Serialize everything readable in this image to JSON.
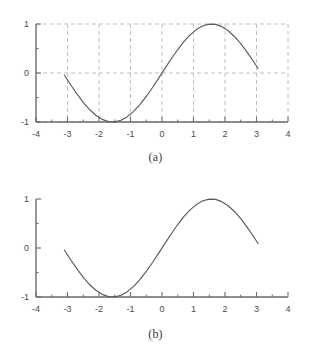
{
  "figure": {
    "background_color": "#ffffff",
    "axis_color": "#6b6b6b",
    "curve_color": "#5a5a5a",
    "grid_color": "#b9b9b9",
    "label_color": "#4a4a4a"
  },
  "panels": [
    {
      "id": "a",
      "caption": "(a)",
      "chart_data": {
        "type": "line",
        "title": "",
        "xlabel": "",
        "ylabel": "",
        "xlim": [
          -4,
          4
        ],
        "ylim": [
          -1,
          1
        ],
        "grid": true,
        "grid_style": "dashed",
        "grid_x": [
          -3,
          -2,
          -1,
          0,
          1,
          2,
          3,
          4
        ],
        "grid_y": [
          -1,
          0,
          1
        ],
        "xticks": [
          -4,
          -3,
          -2,
          -1,
          0,
          1,
          2,
          3,
          4
        ],
        "xticklabels": [
          "-4",
          "-3",
          "-2",
          "-1",
          "0",
          "1",
          "2",
          "3",
          "4"
        ],
        "xminorticks": [
          -3.5,
          -2.5,
          -1.5,
          -0.5,
          0.5,
          1.5,
          2.5,
          3.5
        ],
        "yticks": [
          -1,
          0,
          1
        ],
        "yticklabels": [
          "-1",
          "0",
          "1"
        ],
        "yminorticks": [
          -0.5,
          0.5
        ],
        "series": [
          {
            "name": "sin(x)",
            "x": [
              -3.1,
              -2.9,
              -2.7,
              -2.5,
              -2.3,
              -2.1,
              -1.9,
              -1.7,
              -1.5,
              -1.3,
              -1.1,
              -0.9,
              -0.7,
              -0.5,
              -0.3,
              -0.1,
              0.1,
              0.3,
              0.5,
              0.7,
              0.9,
              1.1,
              1.3,
              1.5,
              1.7,
              1.9,
              2.1,
              2.3,
              2.5,
              2.7,
              2.9,
              3.05
            ],
            "y": [
              -0.042,
              -0.239,
              -0.427,
              -0.599,
              -0.746,
              -0.863,
              -0.946,
              -0.992,
              -0.997,
              -0.964,
              -0.891,
              -0.783,
              -0.644,
              -0.479,
              -0.296,
              -0.1,
              0.1,
              0.296,
              0.479,
              0.644,
              0.783,
              0.891,
              0.964,
              0.997,
              0.992,
              0.946,
              0.863,
              0.746,
              0.599,
              0.427,
              0.239,
              0.092
            ]
          }
        ]
      }
    },
    {
      "id": "b",
      "caption": "(b)",
      "chart_data": {
        "type": "line",
        "title": "",
        "xlabel": "",
        "ylabel": "",
        "xlim": [
          -4,
          4
        ],
        "ylim": [
          -1,
          1
        ],
        "grid": false,
        "grid_style": "none",
        "grid_x": [],
        "grid_y": [],
        "xticks": [
          -4,
          -3,
          -2,
          -1,
          0,
          1,
          2,
          3,
          4
        ],
        "xticklabels": [
          "-4",
          "-3",
          "-2",
          "-1",
          "0",
          "1",
          "2",
          "3",
          "4"
        ],
        "xminorticks": [
          -3.5,
          -2.5,
          -1.5,
          -0.5,
          0.5,
          1.5,
          2.5,
          3.5
        ],
        "yticks": [
          -1,
          0,
          1
        ],
        "yticklabels": [
          "-1",
          "0",
          "1"
        ],
        "yminorticks": [
          -0.5,
          0.5
        ],
        "series": [
          {
            "name": "sin(x)",
            "x": [
              -3.1,
              -2.9,
              -2.7,
              -2.5,
              -2.3,
              -2.1,
              -1.9,
              -1.7,
              -1.5,
              -1.3,
              -1.1,
              -0.9,
              -0.7,
              -0.5,
              -0.3,
              -0.1,
              0.1,
              0.3,
              0.5,
              0.7,
              0.9,
              1.1,
              1.3,
              1.5,
              1.7,
              1.9,
              2.1,
              2.3,
              2.5,
              2.7,
              2.9,
              3.05
            ],
            "y": [
              -0.042,
              -0.239,
              -0.427,
              -0.599,
              -0.746,
              -0.863,
              -0.946,
              -0.992,
              -0.997,
              -0.964,
              -0.891,
              -0.783,
              -0.644,
              -0.479,
              -0.296,
              -0.1,
              0.1,
              0.296,
              0.479,
              0.644,
              0.783,
              0.891,
              0.964,
              0.997,
              0.992,
              0.946,
              0.863,
              0.746,
              0.599,
              0.427,
              0.239,
              0.092
            ]
          }
        ]
      }
    }
  ]
}
